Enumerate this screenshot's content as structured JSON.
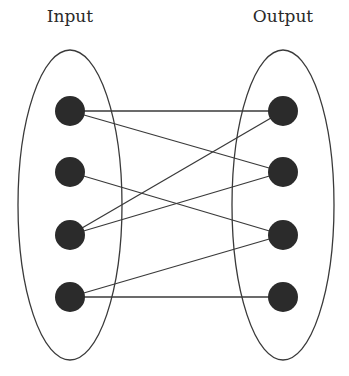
{
  "diagram": {
    "type": "bipartite-mapping",
    "sets": [
      {
        "id": "input",
        "label": "Input",
        "cx": 70,
        "cy": 205,
        "rx": 52,
        "ry": 155
      },
      {
        "id": "output",
        "label": "Output",
        "cx": 283,
        "cy": 205,
        "rx": 51,
        "ry": 155
      }
    ],
    "nodes": [
      {
        "id": "I1",
        "set": "input",
        "x": 70,
        "y": 111
      },
      {
        "id": "I2",
        "set": "input",
        "x": 70,
        "y": 172
      },
      {
        "id": "I3",
        "set": "input",
        "x": 70,
        "y": 235
      },
      {
        "id": "I4",
        "set": "input",
        "x": 70,
        "y": 297
      },
      {
        "id": "O1",
        "set": "output",
        "x": 283,
        "y": 111
      },
      {
        "id": "O2",
        "set": "output",
        "x": 283,
        "y": 172
      },
      {
        "id": "O3",
        "set": "output",
        "x": 283,
        "y": 235
      },
      {
        "id": "O4",
        "set": "output",
        "x": 283,
        "y": 297
      }
    ],
    "edges": [
      {
        "from": "I1",
        "to": "O1"
      },
      {
        "from": "I1",
        "to": "O2"
      },
      {
        "from": "I2",
        "to": "O3"
      },
      {
        "from": "I3",
        "to": "O1"
      },
      {
        "from": "I3",
        "to": "O2"
      },
      {
        "from": "I4",
        "to": "O3"
      },
      {
        "from": "I4",
        "to": "O4"
      }
    ],
    "node_radius": 15,
    "colors": {
      "node": "#2b2b2b",
      "stroke": "#3a3a3a",
      "background": "#ffffff"
    }
  }
}
